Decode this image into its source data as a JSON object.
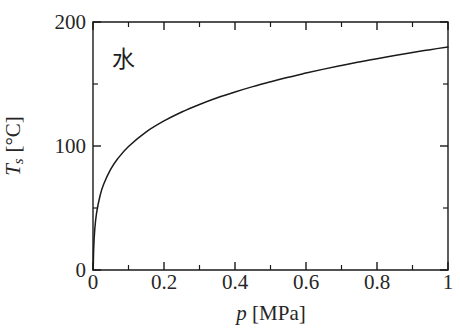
{
  "chart_data": {
    "type": "line",
    "title": "",
    "subtitle": "",
    "xlabel": "p [MPa]",
    "xlabel_symbol": "p",
    "xlabel_unit": "[MPa]",
    "ylabel": "Ts [°C]",
    "ylabel_symbol": "T",
    "ylabel_subscript": "s",
    "ylabel_unit": "[°C]",
    "xlim": [
      0,
      1
    ],
    "ylim": [
      0,
      200
    ],
    "grid": false,
    "legend": "none",
    "annotations": [
      {
        "text": "水",
        "x": 0.055,
        "y": 177,
        "meaning": "water"
      }
    ],
    "x_ticks_major": [
      0,
      0.2,
      0.4,
      0.6,
      0.8,
      1
    ],
    "x_tick_labels": [
      "0",
      "0.2",
      "0.4",
      "0.6",
      "0.8",
      "1"
    ],
    "x_ticks_minor": [
      0.1,
      0.3,
      0.5,
      0.7,
      0.9
    ],
    "y_ticks_major": [
      0,
      100,
      200
    ],
    "y_tick_labels": [
      "0",
      "100",
      "200"
    ],
    "y_ticks_minor": [
      50,
      150
    ],
    "series": [
      {
        "name": "Saturation temperature of water",
        "color": "#1a1a1a",
        "x": [
          0.0006,
          0.002,
          0.005,
          0.01,
          0.02,
          0.03,
          0.05,
          0.07,
          0.1,
          0.15,
          0.2,
          0.25,
          0.3,
          0.35,
          0.4,
          0.45,
          0.5,
          0.55,
          0.6,
          0.65,
          0.7,
          0.75,
          0.8,
          0.85,
          0.9,
          0.95,
          1.0
        ],
        "y": [
          0,
          17.5,
          32.9,
          45.8,
          60.1,
          69.1,
          81.3,
          89.9,
          99.6,
          111.4,
          120.2,
          127.4,
          133.5,
          138.9,
          143.6,
          147.9,
          151.8,
          155.5,
          158.8,
          162.0,
          165.0,
          167.8,
          170.4,
          172.9,
          175.4,
          177.7,
          179.9
        ]
      }
    ],
    "colors": {
      "line": "#1a1a1a",
      "axis": "#1a1a1a",
      "background": "#ffffff",
      "text": "#262626"
    }
  },
  "plot_box": {
    "left": 93,
    "right": 448,
    "top": 22,
    "bottom": 270
  }
}
